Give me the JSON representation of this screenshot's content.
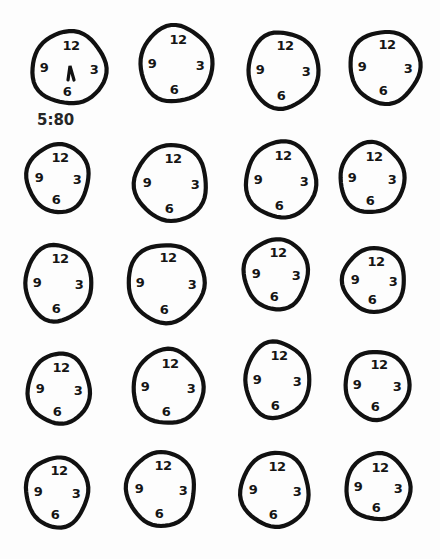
{
  "numerals": {
    "n12": "12",
    "n3": "3",
    "n6": "6",
    "n9": "9"
  },
  "first_clock_time_label": "5:80",
  "grid": {
    "rows": 5,
    "columns": 4
  },
  "clocks": [
    {
      "id": 1,
      "cx": 69,
      "cy": 68,
      "rx": 37,
      "ry": 36,
      "hands": true
    },
    {
      "id": 2,
      "cx": 176,
      "cy": 64,
      "rx": 36,
      "ry": 38,
      "hands": false
    },
    {
      "id": 3,
      "cx": 283,
      "cy": 70,
      "rx": 35,
      "ry": 38,
      "hands": false
    },
    {
      "id": 4,
      "cx": 385,
      "cy": 67,
      "rx": 35,
      "ry": 36,
      "hands": false
    },
    {
      "id": 5,
      "cx": 58,
      "cy": 178,
      "rx": 31,
      "ry": 34,
      "hands": false
    },
    {
      "id": 6,
      "cx": 171,
      "cy": 183,
      "rx": 36,
      "ry": 38,
      "hands": false
    },
    {
      "id": 7,
      "cx": 281,
      "cy": 180,
      "rx": 35,
      "ry": 38,
      "hands": false
    },
    {
      "id": 8,
      "cx": 372,
      "cy": 178,
      "rx": 32,
      "ry": 35,
      "hands": false
    },
    {
      "id": 9,
      "cx": 58,
      "cy": 283,
      "rx": 33,
      "ry": 38,
      "hands": false
    },
    {
      "id": 10,
      "cx": 166,
      "cy": 283,
      "rx": 38,
      "ry": 39,
      "hands": false
    },
    {
      "id": 11,
      "cx": 276,
      "cy": 274,
      "rx": 32,
      "ry": 35,
      "hands": false
    },
    {
      "id": 12,
      "cx": 374,
      "cy": 280,
      "rx": 31,
      "ry": 32,
      "hands": false
    },
    {
      "id": 13,
      "cx": 59,
      "cy": 389,
      "rx": 31,
      "ry": 35,
      "hands": false
    },
    {
      "id": 14,
      "cx": 168,
      "cy": 387,
      "rx": 35,
      "ry": 37,
      "hands": false
    },
    {
      "id": 15,
      "cx": 277,
      "cy": 380,
      "rx": 32,
      "ry": 38,
      "hands": false
    },
    {
      "id": 16,
      "cx": 377,
      "cy": 385,
      "rx": 32,
      "ry": 34,
      "hands": false
    },
    {
      "id": 17,
      "cx": 57,
      "cy": 492,
      "rx": 31,
      "ry": 35,
      "hands": false
    },
    {
      "id": 18,
      "cx": 161,
      "cy": 489,
      "rx": 34,
      "ry": 37,
      "hands": false
    },
    {
      "id": 19,
      "cx": 275,
      "cy": 490,
      "rx": 34,
      "ry": 37,
      "hands": false
    },
    {
      "id": 20,
      "cx": 378,
      "cy": 487,
      "rx": 32,
      "ry": 33,
      "hands": false
    }
  ]
}
